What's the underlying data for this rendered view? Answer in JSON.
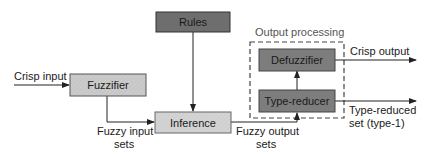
{
  "diagram": {
    "group": {
      "label": "Output processing",
      "border_color": "#444444"
    },
    "nodes": {
      "rules": {
        "label": "Rules",
        "fill": "#6e6e6e"
      },
      "fuzzifier": {
        "label": "Fuzzifier",
        "fill": "#c9c9c9"
      },
      "inference": {
        "label": "Inference",
        "fill": "#d2d2d2"
      },
      "defuzzifier": {
        "label": "Defuzzifier",
        "fill": "#7d7d7d"
      },
      "type_reducer": {
        "label": "Type-reducer",
        "fill": "#7d7d7d"
      }
    },
    "edge_labels": {
      "crisp_input": "Crisp input",
      "fuzzy_input_sets_1": "Fuzzy input",
      "fuzzy_input_sets_2": "sets",
      "fuzzy_output_sets_1": "Fuzzy output",
      "fuzzy_output_sets_2": "sets",
      "crisp_output": "Crisp output",
      "type_reduced_1": "Type-reduced",
      "type_reduced_2": "set (type-1)"
    },
    "line_color": "#222222"
  }
}
